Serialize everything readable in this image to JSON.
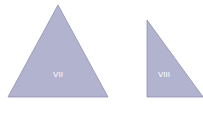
{
  "shapes": [
    {
      "id": "VII",
      "label": "VII",
      "type": "isosceles-triangle"
    },
    {
      "id": "VIII",
      "label": "VIII",
      "type": "right-triangle"
    }
  ],
  "colors": {
    "fill": "#b2b4cf",
    "stroke": "#8e91b0",
    "label": "#ffffff"
  }
}
